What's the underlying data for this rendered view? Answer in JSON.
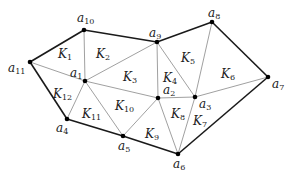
{
  "diagram": {
    "type": "triangulation",
    "nodes": [
      {
        "id": "a1",
        "label": "a",
        "sub": "1",
        "x": 85,
        "y": 81,
        "lx": 70,
        "ly": 77
      },
      {
        "id": "a2",
        "label": "a",
        "sub": "2",
        "x": 158,
        "y": 98,
        "lx": 163,
        "ly": 94
      },
      {
        "id": "a3",
        "label": "a",
        "sub": "3",
        "x": 195,
        "y": 97,
        "lx": 199,
        "ly": 108
      },
      {
        "id": "a4",
        "label": "a",
        "sub": "4",
        "x": 67,
        "y": 119,
        "lx": 56,
        "ly": 132
      },
      {
        "id": "a5",
        "label": "a",
        "sub": "5",
        "x": 123,
        "y": 136,
        "lx": 118,
        "ly": 150
      },
      {
        "id": "a6",
        "label": "a",
        "sub": "6",
        "x": 178,
        "y": 154,
        "lx": 173,
        "ly": 168
      },
      {
        "id": "a7",
        "label": "a",
        "sub": "7",
        "x": 268,
        "y": 77,
        "lx": 272,
        "ly": 88
      },
      {
        "id": "a8",
        "label": "a",
        "sub": "8",
        "x": 212,
        "y": 22,
        "lx": 208,
        "ly": 17
      },
      {
        "id": "a9",
        "label": "a",
        "sub": "9",
        "x": 157,
        "y": 42,
        "lx": 149,
        "ly": 37
      },
      {
        "id": "a10",
        "label": "a",
        "sub": "10",
        "x": 84,
        "y": 30,
        "lx": 77,
        "ly": 22
      },
      {
        "id": "a11",
        "label": "a",
        "sub": "11",
        "x": 30,
        "y": 62,
        "lx": 8,
        "ly": 72
      }
    ],
    "boundary_edges": [
      [
        "a10",
        "a9"
      ],
      [
        "a9",
        "a8"
      ],
      [
        "a8",
        "a7"
      ],
      [
        "a7",
        "a6"
      ],
      [
        "a6",
        "a5"
      ],
      [
        "a5",
        "a4"
      ],
      [
        "a4",
        "a11"
      ],
      [
        "a11",
        "a10"
      ]
    ],
    "interior_edges": [
      [
        "a11",
        "a1"
      ],
      [
        "a10",
        "a1"
      ],
      [
        "a1",
        "a9"
      ],
      [
        "a1",
        "a2"
      ],
      [
        "a1",
        "a4"
      ],
      [
        "a1",
        "a5"
      ],
      [
        "a9",
        "a2"
      ],
      [
        "a9",
        "a3"
      ],
      [
        "a8",
        "a3"
      ],
      [
        "a2",
        "a3"
      ],
      [
        "a3",
        "a7"
      ],
      [
        "a2",
        "a5"
      ],
      [
        "a2",
        "a6"
      ],
      [
        "a3",
        "a6"
      ]
    ],
    "elements": [
      {
        "id": "K1",
        "label": "K",
        "sub": "1",
        "x": 58,
        "y": 58
      },
      {
        "id": "K2",
        "label": "K",
        "sub": "2",
        "x": 96,
        "y": 58
      },
      {
        "id": "K3",
        "label": "K",
        "sub": "3",
        "x": 123,
        "y": 81
      },
      {
        "id": "K4",
        "label": "K",
        "sub": "4",
        "x": 163,
        "y": 82
      },
      {
        "id": "K5",
        "label": "K",
        "sub": "5",
        "x": 181,
        "y": 62
      },
      {
        "id": "K6",
        "label": "K",
        "sub": "6",
        "x": 221,
        "y": 78
      },
      {
        "id": "K7",
        "label": "K",
        "sub": "7",
        "x": 193,
        "y": 125
      },
      {
        "id": "K8",
        "label": "K",
        "sub": "8",
        "x": 171,
        "y": 118
      },
      {
        "id": "K9",
        "label": "K",
        "sub": "9",
        "x": 145,
        "y": 138
      },
      {
        "id": "K10",
        "label": "K",
        "sub": "10",
        "x": 115,
        "y": 110
      },
      {
        "id": "K11",
        "label": "K",
        "sub": "11",
        "x": 82,
        "y": 118
      },
      {
        "id": "K12",
        "label": "K",
        "sub": "12",
        "x": 53,
        "y": 98
      }
    ]
  },
  "colors": {
    "boundary": "#1a1a1a",
    "interior": "#888888",
    "node": "#000000",
    "text": "#222222"
  }
}
